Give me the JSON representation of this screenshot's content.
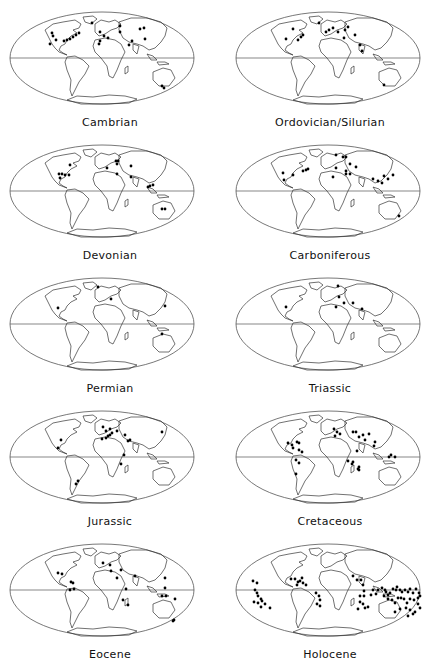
{
  "figure": {
    "colors": {
      "outline": "#555555",
      "land": "#333333",
      "dot": "#000000",
      "background": "#ffffff"
    },
    "panels": [
      {
        "label": "Cambrian",
        "col": 0,
        "row": 0,
        "dots": [
          [
            52,
            33
          ],
          [
            53,
            36
          ],
          [
            56,
            40
          ],
          [
            50,
            44
          ],
          [
            64,
            41
          ],
          [
            67,
            40
          ],
          [
            70,
            39
          ],
          [
            73,
            37
          ],
          [
            76,
            35
          ],
          [
            79,
            33
          ],
          [
            92,
            23
          ],
          [
            100,
            32
          ],
          [
            104,
            36
          ],
          [
            100,
            41
          ],
          [
            99,
            44
          ],
          [
            108,
            38
          ],
          [
            120,
            32
          ],
          [
            120,
            26
          ],
          [
            132,
            41
          ],
          [
            129,
            45
          ],
          [
            145,
            39
          ],
          [
            140,
            29
          ],
          [
            144,
            28
          ],
          [
            162,
            86
          ],
          [
            164,
            88
          ]
        ]
      },
      {
        "label": "Ordovician/Silurian",
        "col": 1,
        "row": 0,
        "dots": [
          [
            73,
            29
          ],
          [
            66,
            39
          ],
          [
            78,
            40
          ],
          [
            81,
            37
          ],
          [
            83,
            35
          ],
          [
            99,
            23
          ],
          [
            106,
            32
          ],
          [
            109,
            30
          ],
          [
            113,
            28
          ],
          [
            118,
            32
          ],
          [
            125,
            30
          ],
          [
            128,
            27
          ],
          [
            124,
            38
          ],
          [
            135,
            35
          ],
          [
            140,
            45
          ],
          [
            142,
            51
          ],
          [
            164,
            85
          ]
        ]
      },
      {
        "label": "Devonian",
        "col": 0,
        "row": 1,
        "dots": [
          [
            70,
            32
          ],
          [
            59,
            41
          ],
          [
            62,
            41
          ],
          [
            65,
            42
          ],
          [
            60,
            45
          ],
          [
            69,
            42
          ],
          [
            107,
            35
          ],
          [
            118,
            28
          ],
          [
            117,
            31
          ],
          [
            116,
            28
          ],
          [
            131,
            33
          ],
          [
            117,
            41
          ],
          [
            131,
            44
          ],
          [
            150,
            53
          ],
          [
            153,
            52
          ],
          [
            148,
            54
          ],
          [
            162,
            76
          ],
          [
            165,
            76
          ]
        ]
      },
      {
        "label": "Carboniferous",
        "col": 1,
        "row": 1,
        "dots": [
          [
            116,
            22
          ],
          [
            126,
            24
          ],
          [
            123,
            24
          ],
          [
            130,
            31
          ],
          [
            136,
            34
          ],
          [
            116,
            35
          ],
          [
            126,
            38
          ],
          [
            130,
            41
          ],
          [
            113,
            44
          ],
          [
            126,
            41
          ],
          [
            88,
            36
          ],
          [
            86,
            37
          ],
          [
            83,
            38
          ],
          [
            73,
            42
          ],
          [
            63,
            40
          ],
          [
            64,
            47
          ],
          [
            153,
            46
          ],
          [
            158,
            48
          ],
          [
            162,
            50
          ],
          [
            164,
            43
          ],
          [
            173,
            42
          ],
          [
            168,
            46
          ],
          [
            179,
            83
          ]
        ]
      },
      {
        "label": "Permian",
        "col": 0,
        "row": 2,
        "dots": [
          [
            98,
            21
          ],
          [
            111,
            33
          ],
          [
            58,
            42
          ],
          [
            165,
            40
          ],
          [
            162,
            68
          ]
        ]
      },
      {
        "label": "Triassic",
        "col": 1,
        "row": 2,
        "dots": [
          [
            118,
            20
          ],
          [
            119,
            31
          ],
          [
            124,
            37
          ],
          [
            116,
            41
          ],
          [
            133,
            37
          ],
          [
            142,
            43
          ],
          [
            66,
            41
          ]
        ]
      },
      {
        "label": "Jurassic",
        "col": 0,
        "row": 3,
        "dots": [
          [
            103,
            28
          ],
          [
            106,
            32
          ],
          [
            110,
            30
          ],
          [
            112,
            34
          ],
          [
            117,
            32
          ],
          [
            108,
            37
          ],
          [
            102,
            40
          ],
          [
            106,
            39
          ],
          [
            110,
            36
          ],
          [
            125,
            36
          ],
          [
            130,
            41
          ],
          [
            128,
            42
          ],
          [
            124,
            56
          ],
          [
            121,
            65
          ],
          [
            61,
            41
          ],
          [
            58,
            49
          ],
          [
            76,
            85
          ],
          [
            78,
            82
          ],
          [
            162,
            33
          ]
        ]
      },
      {
        "label": "Cretaceous",
        "col": 1,
        "row": 3,
        "dots": [
          [
            114,
            30
          ],
          [
            117,
            33
          ],
          [
            115,
            37
          ],
          [
            120,
            35
          ],
          [
            133,
            33
          ],
          [
            136,
            33
          ],
          [
            143,
            36
          ],
          [
            139,
            38
          ],
          [
            149,
            35
          ],
          [
            145,
            41
          ],
          [
            155,
            43
          ],
          [
            154,
            47
          ],
          [
            171,
            56
          ],
          [
            175,
            58
          ],
          [
            169,
            58
          ],
          [
            68,
            44
          ],
          [
            72,
            46
          ],
          [
            73,
            49
          ],
          [
            77,
            43
          ],
          [
            79,
            44
          ],
          [
            79,
            51
          ],
          [
            82,
            53
          ],
          [
            76,
            61
          ],
          [
            79,
            64
          ],
          [
            76,
            75
          ],
          [
            137,
            52
          ],
          [
            128,
            62
          ],
          [
            132,
            65
          ],
          [
            138,
            70
          ],
          [
            139,
            71
          ],
          [
            133,
            63
          ],
          [
            139,
            68
          ]
        ]
      },
      {
        "label": "Eocene",
        "col": 0,
        "row": 4,
        "dots": [
          [
            58,
            41
          ],
          [
            62,
            42
          ],
          [
            71,
            50
          ],
          [
            73,
            51
          ],
          [
            70,
            58
          ],
          [
            74,
            57
          ],
          [
            103,
            31
          ],
          [
            110,
            33
          ],
          [
            111,
            39
          ],
          [
            121,
            38
          ],
          [
            117,
            46
          ],
          [
            135,
            44
          ],
          [
            165,
            46
          ],
          [
            165,
            56
          ],
          [
            162,
            64
          ],
          [
            166,
            64
          ],
          [
            175,
            67
          ],
          [
            126,
            57
          ],
          [
            123,
            68
          ],
          [
            128,
            73
          ],
          [
            174,
            88
          ],
          [
            173,
            89
          ]
        ]
      },
      {
        "label": "Holocene",
        "col": 1,
        "row": 4,
        "dots": [
          [
            33,
            49
          ],
          [
            37,
            51
          ],
          [
            35,
            58
          ],
          [
            37,
            61
          ],
          [
            38,
            64
          ],
          [
            34,
            70
          ],
          [
            38,
            71
          ],
          [
            42,
            69
          ],
          [
            41,
            67
          ],
          [
            41,
            75
          ],
          [
            45,
            72
          ],
          [
            50,
            76
          ],
          [
            71,
            47
          ],
          [
            75,
            47
          ],
          [
            78,
            50
          ],
          [
            80,
            49
          ],
          [
            82,
            46
          ],
          [
            83,
            51
          ],
          [
            77,
            53
          ],
          [
            86,
            53
          ],
          [
            96,
            61
          ],
          [
            99,
            64
          ],
          [
            100,
            68
          ],
          [
            97,
            72
          ],
          [
            100,
            74
          ],
          [
            133,
            44
          ],
          [
            137,
            48
          ],
          [
            141,
            48
          ],
          [
            143,
            53
          ],
          [
            144,
            59
          ],
          [
            144,
            64
          ],
          [
            140,
            64
          ],
          [
            140,
            70
          ],
          [
            138,
            77
          ],
          [
            143,
            72
          ],
          [
            145,
            76
          ],
          [
            148,
            75
          ],
          [
            151,
            63
          ],
          [
            153,
            58
          ],
          [
            156,
            62
          ],
          [
            158,
            58
          ],
          [
            162,
            56
          ],
          [
            165,
            58
          ],
          [
            166,
            60
          ],
          [
            168,
            63
          ],
          [
            170,
            61
          ],
          [
            173,
            57
          ],
          [
            176,
            58
          ],
          [
            177,
            55
          ],
          [
            180,
            58
          ],
          [
            182,
            60
          ],
          [
            185,
            58
          ],
          [
            188,
            60
          ],
          [
            190,
            57
          ],
          [
            193,
            61
          ],
          [
            196,
            57
          ],
          [
            199,
            61
          ],
          [
            164,
            64
          ],
          [
            168,
            67
          ],
          [
            172,
            68
          ],
          [
            175,
            71
          ],
          [
            178,
            66
          ],
          [
            181,
            66
          ],
          [
            184,
            67
          ],
          [
            187,
            71
          ],
          [
            190,
            67
          ],
          [
            194,
            68
          ],
          [
            198,
            72
          ],
          [
            200,
            76
          ],
          [
            200,
            64
          ],
          [
            198,
            66
          ],
          [
            186,
            76
          ],
          [
            190,
            78
          ],
          [
            195,
            80
          ],
          [
            188,
            84
          ],
          [
            193,
            82
          ],
          [
            180,
            77
          ],
          [
            175,
            80
          ]
        ]
      }
    ]
  }
}
